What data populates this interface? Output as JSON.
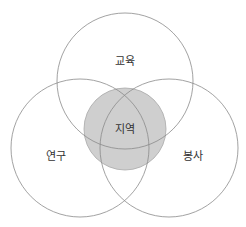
{
  "diagram": {
    "type": "venn",
    "colors": {
      "stroke": "#8a8a8a",
      "center_fill": "#cfcfcf",
      "center_stroke": "#a8a8a8",
      "label": "#333333",
      "background": "#ffffff"
    },
    "sets": [
      {
        "id": "top",
        "label": "교육"
      },
      {
        "id": "left",
        "label": "연구"
      },
      {
        "id": "right",
        "label": "봉사"
      }
    ],
    "center": {
      "label": "지역",
      "shaded": true
    }
  }
}
